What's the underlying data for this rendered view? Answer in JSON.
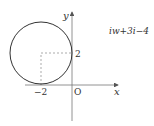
{
  "diagram": {
    "expression": "iw+3i−4",
    "axes": {
      "x_label": "x",
      "y_label": "y",
      "origin_label": "O"
    },
    "ticks": {
      "x_tick": "−2",
      "y_tick": "2"
    },
    "circle": {
      "center": [
        -2,
        2
      ],
      "radius": 2
    }
  }
}
